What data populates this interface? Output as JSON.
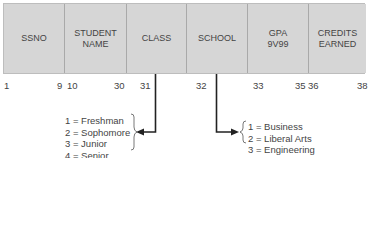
{
  "record": {
    "fields": [
      {
        "name": "SSNO",
        "start": "1",
        "end": "9"
      },
      {
        "name": "STUDENT\nNAME",
        "start": "10",
        "end": "30"
      },
      {
        "name": "CLASS",
        "start": "31",
        "end": ""
      },
      {
        "name": "SCHOOL",
        "start": "32",
        "end": ""
      },
      {
        "name": "GPA\n9V99",
        "start": "33",
        "end": "35"
      },
      {
        "name": "CREDITS\nEARNED",
        "start": "36",
        "end": "38"
      }
    ]
  },
  "class_codes": {
    "items": [
      "1 = Freshman",
      "2 = Sophomore",
      "3 = Junior",
      "4 = Senior"
    ]
  },
  "school_codes": {
    "items": [
      "1 = Business",
      "2 = Liberal Arts",
      "3 = Engineering"
    ]
  },
  "colors": {
    "field_fill": "#d6d6d6",
    "line": "#222222"
  }
}
